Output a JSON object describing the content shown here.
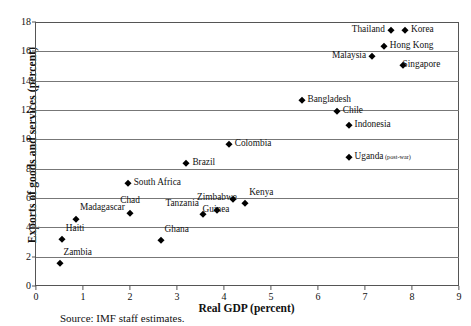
{
  "chart_data": {
    "type": "scatter",
    "title": "",
    "xlabel": "Real GDP (percent)",
    "ylabel": "Exports of goods and services (percent)",
    "xlim": [
      0,
      9
    ],
    "ylim": [
      0,
      18
    ],
    "xticks": [
      "0",
      "1",
      "2",
      "3",
      "4",
      "5",
      "6",
      "7",
      "8",
      "9"
    ],
    "yticks": [
      "0",
      "2",
      "4",
      "6",
      "8",
      "10",
      "12",
      "14",
      "16",
      "18"
    ],
    "grid": "horizontal",
    "legend": "none",
    "marker": "diamond",
    "marker_color": "#000000",
    "points": [
      {
        "label": "Zambia",
        "x": 0.5,
        "y": 1.55,
        "pos": "above-right"
      },
      {
        "label": "Haiti",
        "x": 0.55,
        "y": 3.2,
        "pos": "above-right"
      },
      {
        "label": "Madagascar",
        "x": 0.85,
        "y": 4.6,
        "pos": "above-right"
      },
      {
        "label": "Chad",
        "x": 2.0,
        "y": 5.0,
        "pos": "above"
      },
      {
        "label": "Ghana",
        "x": 2.65,
        "y": 3.15,
        "pos": "above-right"
      },
      {
        "label": "South Africa",
        "x": 1.95,
        "y": 7.0,
        "pos": "right"
      },
      {
        "label": "Brazil",
        "x": 3.2,
        "y": 8.4,
        "pos": "right"
      },
      {
        "label": "Tanzania",
        "x": 3.55,
        "y": 4.9,
        "pos": "above-left"
      },
      {
        "label": "Zimbabwe",
        "x": 3.85,
        "y": 5.2,
        "pos": "above"
      },
      {
        "label": "Colombia",
        "x": 4.1,
        "y": 9.7,
        "pos": "right"
      },
      {
        "label": "Guinea",
        "x": 4.2,
        "y": 5.9,
        "pos": "below-left"
      },
      {
        "label": "Kenya",
        "x": 4.45,
        "y": 5.65,
        "pos": "above-right"
      },
      {
        "label": "Bangladesh",
        "x": 5.65,
        "y": 12.7,
        "pos": "right"
      },
      {
        "label": "Chile",
        "x": 6.4,
        "y": 11.9,
        "pos": "right"
      },
      {
        "label": "Indonesia",
        "x": 6.65,
        "y": 11.0,
        "pos": "right"
      },
      {
        "label": "Uganda",
        "x": 6.65,
        "y": 8.8,
        "pos": "right",
        "suffix": "(post-war)"
      },
      {
        "label": "Malaysia",
        "x": 7.15,
        "y": 15.7,
        "pos": "left"
      },
      {
        "label": "Hong Kong",
        "x": 7.4,
        "y": 16.35,
        "pos": "right"
      },
      {
        "label": "Thailand",
        "x": 7.55,
        "y": 17.45,
        "pos": "left"
      },
      {
        "label": "Korea",
        "x": 7.85,
        "y": 17.45,
        "pos": "right"
      },
      {
        "label": "Singapore",
        "x": 7.8,
        "y": 15.1,
        "pos": "below-right"
      }
    ]
  },
  "source_note": "Source: IMF staff estimates."
}
